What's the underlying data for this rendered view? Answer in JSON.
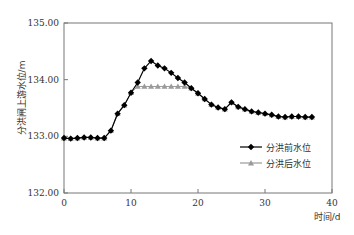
{
  "chart_data": {
    "type": "line",
    "title": "",
    "xlabel": "时间/d",
    "ylabel": "分洪闸上游水位/m",
    "xlim": [
      0,
      40
    ],
    "ylim": [
      132.0,
      135.0
    ],
    "xticks": [
      0,
      10,
      20,
      30,
      40
    ],
    "yticks": [
      "132.00",
      "133.00",
      "134.00",
      "135.00"
    ],
    "grid": false,
    "legend_position": "lower right inside",
    "x": [
      0,
      1,
      2,
      3,
      4,
      5,
      6,
      7,
      8,
      9,
      10,
      11,
      12,
      13,
      14,
      15,
      16,
      17,
      18,
      19,
      20,
      21,
      22,
      23,
      24,
      25,
      26,
      27,
      28,
      29,
      30,
      31,
      32,
      33,
      34,
      35,
      36,
      37
    ],
    "series": [
      {
        "name": "分洪前水位",
        "marker": "diamond",
        "color": "#000000",
        "values": [
          132.97,
          132.96,
          132.97,
          132.98,
          132.98,
          132.97,
          132.97,
          133.1,
          133.4,
          133.55,
          133.77,
          133.95,
          134.2,
          134.33,
          134.25,
          134.2,
          134.12,
          134.03,
          133.95,
          133.85,
          133.76,
          133.66,
          133.56,
          133.51,
          133.48,
          133.6,
          133.52,
          133.48,
          133.44,
          133.42,
          133.4,
          133.38,
          133.35,
          133.34,
          133.35,
          133.35,
          133.34,
          133.34
        ]
      },
      {
        "name": "分洪后水位",
        "marker": "triangle",
        "color": "#9a9a9a",
        "values": [
          132.97,
          132.96,
          132.97,
          132.98,
          132.98,
          132.97,
          132.97,
          133.1,
          133.4,
          133.55,
          133.77,
          133.88,
          133.88,
          133.88,
          133.88,
          133.88,
          133.88,
          133.88,
          133.88,
          133.85,
          133.76,
          133.66,
          133.56,
          133.51,
          133.48,
          133.6,
          133.52,
          133.48,
          133.44,
          133.42,
          133.4,
          133.38,
          133.35,
          133.34,
          133.35,
          133.35,
          133.34,
          133.34
        ]
      }
    ]
  }
}
